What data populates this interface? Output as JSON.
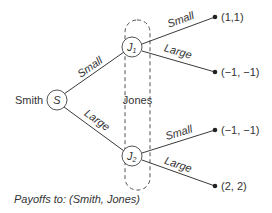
{
  "diagram": {
    "type": "game-tree",
    "players": {
      "root": "Smith",
      "second": "Jones"
    },
    "nodes": {
      "root": {
        "label": "S"
      },
      "j1": {
        "label": "J",
        "subscript": "1"
      },
      "j2": {
        "label": "J",
        "subscript": "2"
      }
    },
    "edges": {
      "root_to_j1": "Small",
      "root_to_j2": "Large",
      "j1_small": "Small",
      "j1_large": "Large",
      "j2_small": "Small",
      "j2_large": "Large"
    },
    "payoffs": {
      "j1_small": "(1,1)",
      "j1_large": "(−1, −1)",
      "j2_small": "(−1, −1)",
      "j2_large": "(2, 2)"
    },
    "information_set_label": "Jones",
    "caption": "Payoffs to: (Smith, Jones)",
    "colors": {
      "line": "#3a3a3a",
      "text": "#333333",
      "background": "#ffffff"
    }
  }
}
